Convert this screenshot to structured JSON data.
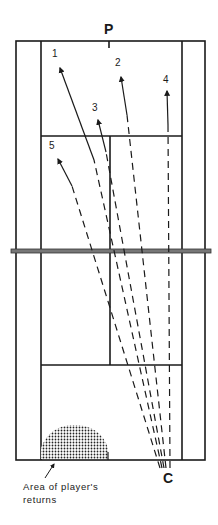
{
  "diagram": {
    "labels": {
      "player": "P",
      "coach": "C",
      "area_line1": "Area of player's",
      "area_line2": "returns"
    },
    "shots": [
      {
        "id": "1",
        "label": "1"
      },
      {
        "id": "2",
        "label": "2"
      },
      {
        "id": "3",
        "label": "3"
      },
      {
        "id": "4",
        "label": "4"
      },
      {
        "id": "5",
        "label": "5"
      }
    ],
    "colors": {
      "line": "#1a1a1a",
      "net": "#555555",
      "background": "#ffffff"
    }
  }
}
